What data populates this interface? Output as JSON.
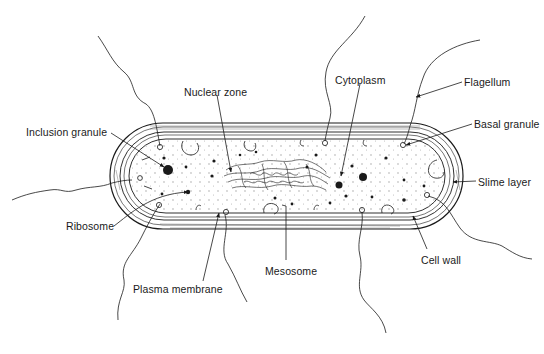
{
  "diagram": {
    "colors": {
      "ink": "#1a1a1a",
      "background": "#ffffff",
      "stipple": "#9a9a9a"
    },
    "labels": [
      {
        "id": "nuclear-zone",
        "text": "Nuclear zone",
        "x": 184,
        "y": 86
      },
      {
        "id": "cytoplasm",
        "text": "Cytoplasm",
        "x": 335,
        "y": 74
      },
      {
        "id": "flagellum",
        "text": "Flagellum",
        "x": 464,
        "y": 76
      },
      {
        "id": "basal-granule",
        "text": "Basal granule",
        "x": 474,
        "y": 118
      },
      {
        "id": "inclusion-granule",
        "text": "Inclusion granule",
        "x": 26,
        "y": 126
      },
      {
        "id": "slime-layer",
        "text": "Slime layer",
        "x": 478,
        "y": 176
      },
      {
        "id": "ribosome",
        "text": "Ribosome",
        "x": 66,
        "y": 220
      },
      {
        "id": "cell-wall",
        "text": "Cell wall",
        "x": 421,
        "y": 254
      },
      {
        "id": "mesosome",
        "text": "Mesosome",
        "x": 265,
        "y": 265
      },
      {
        "id": "plasma-membrane",
        "text": "Plasma membrane",
        "x": 133,
        "y": 283
      }
    ]
  }
}
